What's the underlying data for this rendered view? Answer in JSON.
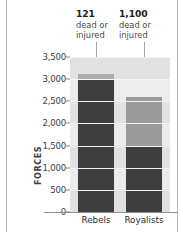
{
  "chart_data": {
    "type": "bar",
    "title": "",
    "subtitle": "",
    "xlabel": "",
    "ylabel": "FORCES",
    "ylim": [
      0,
      3500
    ],
    "grid": true,
    "legend": "none",
    "stacked": true,
    "categories": [
      "Rebels",
      "Royalists"
    ],
    "ytick_labels": [
      "3,500",
      "3,000",
      "2,500",
      "2,000",
      "1,500",
      "1,000",
      "500",
      "0"
    ],
    "ytick_values": [
      3500,
      3000,
      2500,
      2000,
      1500,
      1000,
      500,
      0
    ],
    "series": [
      {
        "name": "surviving",
        "values": [
          3000,
          1500
        ]
      },
      {
        "name": "dead or injured",
        "values": [
          121,
          1100
        ]
      }
    ],
    "totals": [
      3121,
      2600
    ],
    "annotations": [
      {
        "category": "Rebels",
        "value": "121",
        "line1": "dead or",
        "line2": "injured"
      },
      {
        "category": "Royalists",
        "value": "1,100",
        "line1": "dead or",
        "line2": "injured"
      }
    ]
  },
  "colors": {
    "bar_dark": "#3e3e3e",
    "bar_light": "#9a9a9a",
    "bar_cap": "#adadad",
    "plot_background": "#ececec",
    "band": "#e2e2e2",
    "axis": "#8d8d8d",
    "text": "#3d3d3d",
    "annotation_text": "#4b4b4b",
    "leader_line": "#a6a6a6"
  }
}
